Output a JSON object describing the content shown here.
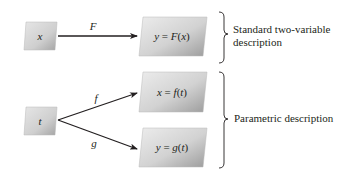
{
  "diagram": {
    "standard": {
      "input_box": {
        "label": "x"
      },
      "arrow": {
        "label": "F"
      },
      "output_box": {
        "lhs": "y",
        "eq": " = ",
        "func": "F",
        "arg_open": "(",
        "arg": "x",
        "arg_close": ")"
      },
      "brace_description": "Standard two-variable description"
    },
    "parametric": {
      "input_box": {
        "label": "t"
      },
      "arrow_top": {
        "label": "f"
      },
      "arrow_bottom": {
        "label": "g"
      },
      "output_box_top": {
        "lhs": "x",
        "eq": " = ",
        "func": "f",
        "arg_open": "(",
        "arg": "t",
        "arg_close": ")"
      },
      "output_box_bottom": {
        "lhs": "y",
        "eq": " = ",
        "func": "g",
        "arg_open": "(",
        "arg": "t",
        "arg_close": ")"
      },
      "brace_description": "Parametric description"
    },
    "colors": {
      "box_light": "#e4e4e4",
      "box_dark": "#9a9a9a",
      "line": "#231f20",
      "text": "#231f20"
    }
  }
}
